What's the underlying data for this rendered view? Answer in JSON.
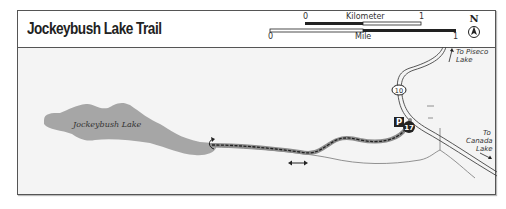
{
  "map": {
    "title": "Jockeybush Lake Trail",
    "scale": {
      "kilometer": {
        "label": "Kilometer",
        "start": "0",
        "end": "1"
      },
      "mile": {
        "label": "Mile",
        "start": "0",
        "end": "1"
      }
    },
    "north_arrow": {
      "label": "N",
      "icon": "north-arrow-icon"
    },
    "lake": {
      "name": "Jockeybush Lake"
    },
    "route": {
      "number": "10",
      "icon": "route-shield-icon"
    },
    "trailhead": {
      "parking_label": "P",
      "number": "17"
    },
    "destinations": {
      "piseco": {
        "line1": "To Piseco",
        "line2": "Lake"
      },
      "canada": {
        "line1": "To",
        "line2": "Canada",
        "line3": "Lake"
      }
    },
    "colors": {
      "lake": "#a6a6a6",
      "background": "#f4f4f4",
      "trail_casing": "#8c8c8c",
      "trail_dash": "#222222",
      "road": "#444444"
    }
  }
}
